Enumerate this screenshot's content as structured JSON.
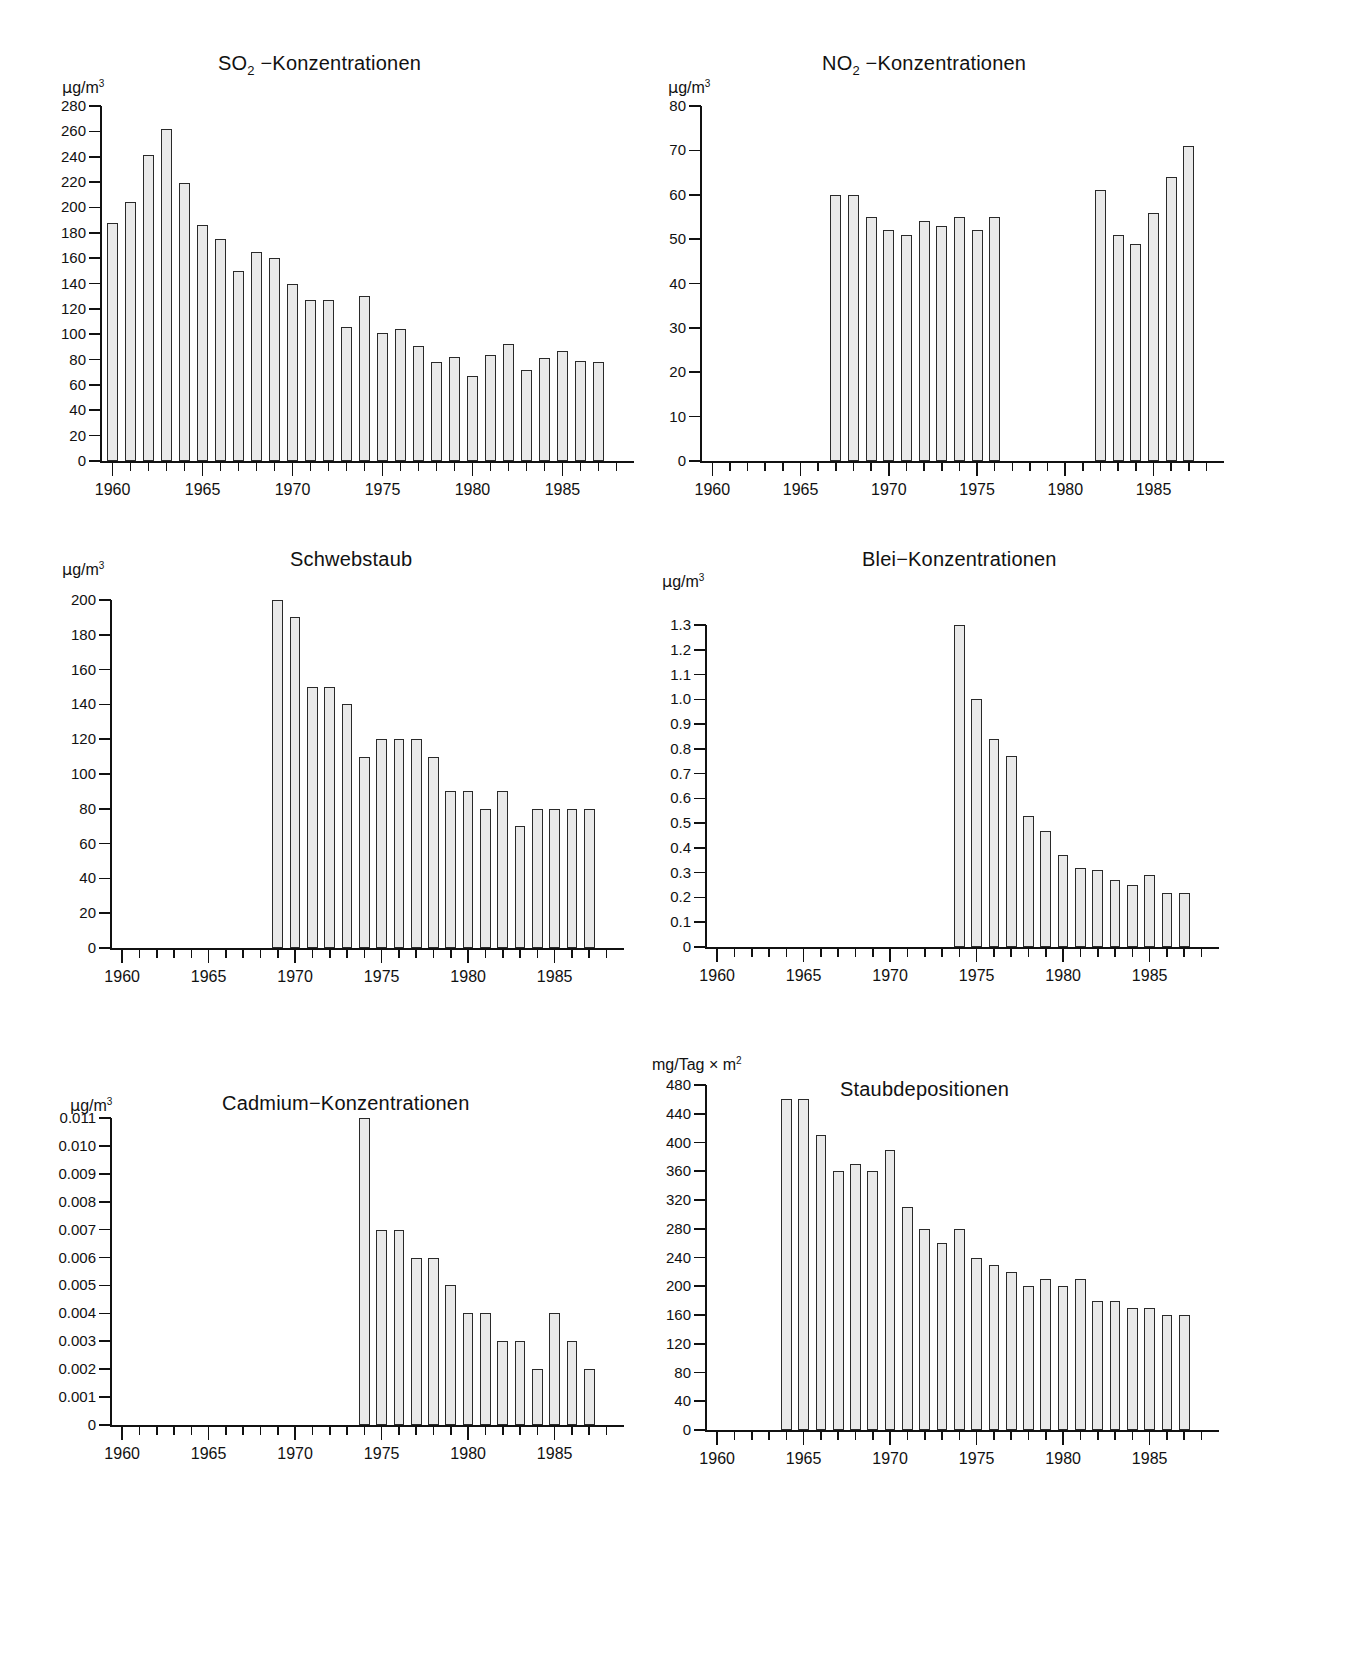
{
  "page": {
    "background": "#ffffff",
    "bar_fill": "#e9e9e9",
    "bar_stroke": "#2a2a2a",
    "axis_color": "#111111"
  },
  "chart_data": [
    {
      "id": "so2",
      "type": "bar",
      "title": "SO₂ −Konzentrationen",
      "title_main": "SO",
      "title_sub": "2",
      "title_rest": " −Konzentrationen",
      "ylabel": "μg/m³",
      "ylabel_main": "g/m",
      "ylabel_sup": "3",
      "xlabel": "",
      "ylim": [
        0,
        280
      ],
      "yticks": [
        0,
        20,
        40,
        60,
        80,
        100,
        120,
        140,
        160,
        180,
        200,
        220,
        240,
        260,
        280
      ],
      "ytick_labels": [
        "0",
        "20",
        "40",
        "60",
        "80",
        "100",
        "120",
        "140",
        "160",
        "180",
        "200",
        "220",
        "240",
        "260",
        "280"
      ],
      "xlim": [
        1959.3,
        1988.2
      ],
      "xticks": [
        1960,
        1965,
        1970,
        1975,
        1980,
        1985
      ],
      "xtick_labels": [
        "1960",
        "1965",
        "1970",
        "1975",
        "1980",
        "1985"
      ],
      "x": [
        1960,
        1961,
        1962,
        1963,
        1964,
        1965,
        1966,
        1967,
        1968,
        1969,
        1970,
        1971,
        1972,
        1973,
        1974,
        1975,
        1976,
        1977,
        1978,
        1979,
        1980,
        1981,
        1982,
        1983,
        1984,
        1985,
        1986,
        1987
      ],
      "values": [
        188,
        204,
        241,
        262,
        219,
        186,
        175,
        150,
        165,
        160,
        140,
        127,
        127,
        106,
        130,
        101,
        104,
        91,
        78,
        82,
        67,
        84,
        92,
        72,
        81,
        87,
        79,
        78
      ],
      "grid": false,
      "legend": "none"
    },
    {
      "id": "no2",
      "type": "bar",
      "title": "NO₂ −Konzentrationen",
      "title_main": "NO",
      "title_sub": "2",
      "title_rest": " −Konzentrationen",
      "ylabel": "μg/m³",
      "ylabel_main": "g/m",
      "ylabel_sup": "3",
      "xlabel": "",
      "ylim": [
        0,
        80
      ],
      "yticks": [
        0,
        10,
        20,
        30,
        40,
        50,
        60,
        70,
        80
      ],
      "ytick_labels": [
        "0",
        "10",
        "20",
        "30",
        "40",
        "50",
        "60",
        "70",
        "80"
      ],
      "xlim": [
        1959.3,
        1988.2
      ],
      "xticks": [
        1960,
        1965,
        1970,
        1975,
        1980,
        1985
      ],
      "xtick_labels": [
        "1960",
        "1965",
        "1970",
        "1975",
        "1980",
        "1985"
      ],
      "x": [
        1967,
        1968,
        1969,
        1970,
        1971,
        1972,
        1973,
        1974,
        1975,
        1976,
        1982,
        1983,
        1984,
        1985,
        1986,
        1987
      ],
      "values": [
        60,
        60,
        55,
        52,
        51,
        54,
        53,
        55,
        52,
        55,
        61,
        51,
        49,
        56,
        64,
        71
      ],
      "grid": false,
      "legend": "none"
    },
    {
      "id": "schwebstaub",
      "type": "bar",
      "title": "Schwebstaub",
      "title_main": "Schwebstaub",
      "title_sub": "",
      "title_rest": "",
      "ylabel": "μg/m³",
      "ylabel_main": "g/m",
      "ylabel_sup": "3",
      "xlabel": "",
      "ylim": [
        0,
        200
      ],
      "yticks": [
        0,
        20,
        40,
        60,
        80,
        100,
        120,
        140,
        160,
        180,
        200
      ],
      "ytick_labels": [
        "0",
        "20",
        "40",
        "60",
        "80",
        "100",
        "120",
        "140",
        "160",
        "180",
        "200"
      ],
      "xlim": [
        1959.3,
        1988.2
      ],
      "xticks": [
        1960,
        1965,
        1970,
        1975,
        1980,
        1985
      ],
      "xtick_labels": [
        "1960",
        "1965",
        "1970",
        "1975",
        "1980",
        "1985"
      ],
      "x": [
        1969,
        1970,
        1971,
        1972,
        1973,
        1974,
        1975,
        1976,
        1977,
        1978,
        1979,
        1980,
        1981,
        1982,
        1983,
        1984,
        1985,
        1986,
        1987
      ],
      "values": [
        200,
        190,
        150,
        150,
        140,
        110,
        120,
        120,
        120,
        110,
        90,
        90,
        80,
        90,
        70,
        80,
        80,
        80,
        80
      ],
      "grid": false,
      "legend": "none"
    },
    {
      "id": "blei",
      "type": "bar",
      "title": "Blei−Konzentrationen",
      "title_main": "Blei−Konzentrationen",
      "title_sub": "",
      "title_rest": "",
      "ylabel": "μg/m³",
      "ylabel_main": "g/m",
      "ylabel_sup": "3",
      "xlabel": "",
      "ylim": [
        0,
        1.3
      ],
      "yticks": [
        0,
        0.1,
        0.2,
        0.3,
        0.4,
        0.5,
        0.6,
        0.7,
        0.8,
        0.9,
        1.0,
        1.1,
        1.2,
        1.3
      ],
      "ytick_labels": [
        "0",
        "0.1",
        "0.2",
        "0.3",
        "0.4",
        "0.5",
        "0.6",
        "0.7",
        "0.8",
        "0.9",
        "1.0",
        "1.1",
        "1.2",
        "1.3"
      ],
      "xlim": [
        1959.3,
        1988.2
      ],
      "xticks": [
        1960,
        1965,
        1970,
        1975,
        1980,
        1985
      ],
      "xtick_labels": [
        "1960",
        "1965",
        "1970",
        "1975",
        "1980",
        "1985"
      ],
      "x": [
        1974,
        1975,
        1976,
        1977,
        1978,
        1979,
        1980,
        1981,
        1982,
        1983,
        1984,
        1985,
        1986,
        1987
      ],
      "values": [
        1.3,
        1.0,
        0.84,
        0.77,
        0.53,
        0.47,
        0.37,
        0.32,
        0.31,
        0.27,
        0.25,
        0.29,
        0.22,
        0.22
      ],
      "grid": false,
      "legend": "none"
    },
    {
      "id": "cadmium",
      "type": "bar",
      "title": "Cadmium−Konzentrationen",
      "title_main": "Cadmium−Konzentrationen",
      "title_sub": "",
      "title_rest": "",
      "ylabel": "μg/m³",
      "ylabel_main": "g/m",
      "ylabel_sup": "3",
      "xlabel": "",
      "ylim": [
        0,
        0.011
      ],
      "yticks": [
        0,
        0.001,
        0.002,
        0.003,
        0.004,
        0.005,
        0.006,
        0.007,
        0.008,
        0.009,
        0.01,
        0.011
      ],
      "ytick_labels": [
        "0",
        "0.001",
        "0.002",
        "0.003",
        "0.004",
        "0.005",
        "0.006",
        "0.007",
        "0.008",
        "0.009",
        "0.010",
        "0.011"
      ],
      "xlim": [
        1959.3,
        1988.2
      ],
      "xticks": [
        1960,
        1965,
        1970,
        1975,
        1980,
        1985
      ],
      "xtick_labels": [
        "1960",
        "1965",
        "1970",
        "1975",
        "1980",
        "1985"
      ],
      "x": [
        1974,
        1975,
        1976,
        1977,
        1978,
        1979,
        1980,
        1981,
        1982,
        1983,
        1984,
        1985,
        1986,
        1987
      ],
      "values": [
        0.011,
        0.007,
        0.007,
        0.006,
        0.006,
        0.005,
        0.004,
        0.004,
        0.003,
        0.003,
        0.002,
        0.004,
        0.003,
        0.002
      ],
      "grid": false,
      "legend": "none"
    },
    {
      "id": "staub",
      "type": "bar",
      "title": "Staubdepositionen",
      "title_main": "Staubdepositionen",
      "title_sub": "",
      "title_rest": "",
      "ylabel": "mg/Tag × m²",
      "ylabel_main": "mg/Tag × m",
      "ylabel_sup": "2",
      "xlabel": "",
      "ylim": [
        0,
        480
      ],
      "yticks": [
        0,
        40,
        80,
        120,
        160,
        200,
        240,
        280,
        320,
        360,
        400,
        440,
        480
      ],
      "ytick_labels": [
        "0",
        "40",
        "80",
        "120",
        "160",
        "200",
        "240",
        "280",
        "320",
        "360",
        "400",
        "440",
        "480"
      ],
      "xlim": [
        1959.3,
        1988.2
      ],
      "xticks": [
        1960,
        1965,
        1970,
        1975,
        1980,
        1985
      ],
      "xtick_labels": [
        "1960",
        "1965",
        "1970",
        "1975",
        "1980",
        "1985"
      ],
      "x": [
        1964,
        1965,
        1966,
        1967,
        1968,
        1969,
        1970,
        1971,
        1972,
        1973,
        1974,
        1975,
        1976,
        1977,
        1978,
        1979,
        1980,
        1981,
        1982,
        1983,
        1984,
        1985,
        1986,
        1987
      ],
      "values": [
        460,
        460,
        410,
        360,
        370,
        360,
        390,
        310,
        280,
        260,
        280,
        240,
        230,
        220,
        200,
        210,
        200,
        210,
        180,
        180,
        170,
        170,
        160,
        160
      ],
      "grid": false,
      "legend": "none"
    }
  ]
}
